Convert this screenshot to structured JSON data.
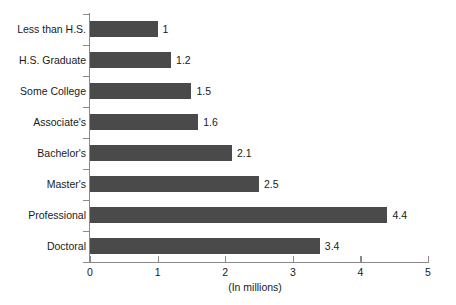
{
  "chart_data": {
    "type": "bar",
    "orientation": "horizontal",
    "title": "",
    "subtitle": "",
    "xlabel": "(In millions)",
    "ylabel": "",
    "categories": [
      "Less than H.S.",
      "H.S. Graduate",
      "Some College",
      "Associate's",
      "Bachelor's",
      "Master's",
      "Professional",
      "Doctoral"
    ],
    "values": [
      1,
      1.2,
      1.5,
      1.6,
      2.1,
      2.5,
      4.4,
      3.4
    ],
    "value_labels": [
      "1",
      "1.2",
      "1.5",
      "1.6",
      "2.1",
      "2.5",
      "4.4",
      "3.4"
    ],
    "xlim": [
      0,
      5
    ],
    "x_ticks": [
      0,
      1,
      2,
      3,
      4,
      5
    ],
    "x_tick_labels": [
      "0",
      "1",
      "2",
      "3",
      "4",
      "5"
    ],
    "grid": false,
    "legend": null,
    "legend_position": "none",
    "bar_color": "#4a4a4a",
    "axis_color": "#8a8a8a",
    "background_color": "#ffffff",
    "text_color": "#1a1a1a"
  }
}
